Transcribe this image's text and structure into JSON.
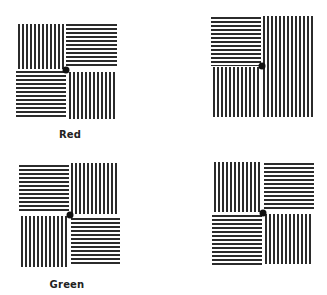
{
  "figure": {
    "panels": [
      {
        "id": "top-left",
        "caption": "Red",
        "quadrants": {
          "top_left": "vertical",
          "top_right": "horizontal",
          "bottom_left": "horizontal",
          "bottom_right": "vertical"
        }
      },
      {
        "id": "top-right",
        "caption": "",
        "quadrants": {
          "top_left": "horizontal",
          "top_right": "vertical",
          "bottom_left": "vertical",
          "bottom_right": "vertical"
        }
      },
      {
        "id": "bottom-left",
        "caption": "Green",
        "quadrants": {
          "top_left": "horizontal",
          "top_right": "vertical",
          "bottom_left": "vertical",
          "bottom_right": "horizontal"
        }
      },
      {
        "id": "bottom-right",
        "caption": "",
        "quadrants": {
          "top_left": "vertical",
          "top_right": "horizontal",
          "bottom_left": "horizontal",
          "bottom_right": "vertical"
        }
      }
    ],
    "colors": {
      "stripe": "#2b2b2b",
      "background": "#ffffff",
      "fixation_dot": "#111111"
    }
  }
}
